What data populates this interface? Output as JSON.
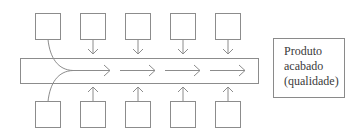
{
  "diagram": {
    "type": "process-flow",
    "stroke_color": "#8c8c8c",
    "top_inputs": [
      {
        "id": "top-1",
        "connector": "curve-merge"
      },
      {
        "id": "top-2",
        "connector": "arrow-down"
      },
      {
        "id": "top-3",
        "connector": "arrow-down"
      },
      {
        "id": "top-4",
        "connector": "arrow-down"
      },
      {
        "id": "top-5",
        "connector": "arrow-down"
      }
    ],
    "bottom_inputs": [
      {
        "id": "bottom-1",
        "connector": "curve-merge"
      },
      {
        "id": "bottom-2",
        "connector": "arrow-up"
      },
      {
        "id": "bottom-3",
        "connector": "arrow-up"
      },
      {
        "id": "bottom-4",
        "connector": "arrow-up"
      },
      {
        "id": "bottom-5",
        "connector": "arrow-up"
      }
    ],
    "flow_arrows": 4,
    "output": {
      "lines": [
        "Produto",
        "acabado",
        "(qualidade)"
      ]
    }
  }
}
